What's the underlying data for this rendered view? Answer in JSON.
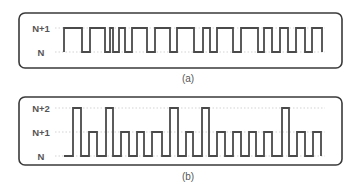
{
  "figure": {
    "panel_a": {
      "caption": "(a)",
      "levels": [
        {
          "label": "N+1",
          "y": 28
        },
        {
          "label": "N",
          "y": 52
        }
      ],
      "box": {
        "x": 19,
        "y": 13,
        "w": 323,
        "h": 55
      },
      "waveform": {
        "description": "Two-level signal alternating between N and N+1",
        "start_x": 64,
        "end_x": 322,
        "segments": [
          [
            64,
            1
          ],
          [
            82,
            0
          ],
          [
            90,
            1
          ],
          [
            105,
            0
          ],
          [
            110,
            1
          ],
          [
            113,
            0
          ],
          [
            119,
            1
          ],
          [
            125,
            0
          ],
          [
            132,
            1
          ],
          [
            147,
            0
          ],
          [
            155,
            1
          ],
          [
            170,
            0
          ],
          [
            177,
            1
          ],
          [
            194,
            0
          ],
          [
            203,
            1
          ],
          [
            210,
            0
          ],
          [
            217,
            1
          ],
          [
            233,
            0
          ],
          [
            241,
            1
          ],
          [
            258,
            0
          ],
          [
            264,
            1
          ],
          [
            272,
            0
          ],
          [
            280,
            1
          ],
          [
            288,
            0
          ],
          [
            296,
            1
          ],
          [
            305,
            0
          ],
          [
            312,
            1
          ],
          [
            322,
            0
          ]
        ]
      }
    },
    "panel_b": {
      "caption": "(b)",
      "levels": [
        {
          "label": "N+2",
          "y": 108
        },
        {
          "label": "N+1",
          "y": 132
        },
        {
          "label": "N",
          "y": 156
        }
      ],
      "box": {
        "x": 19,
        "y": 97,
        "w": 323,
        "h": 68
      },
      "waveform": {
        "description": "Three-level pulse train returning to N between pulses",
        "baseline_start_x": 64,
        "pulses": [
          {
            "x0": 73,
            "x1": 81,
            "level": 2
          },
          {
            "x0": 89,
            "x1": 97,
            "level": 1
          },
          {
            "x0": 106,
            "x1": 113,
            "level": 2
          },
          {
            "x0": 121,
            "x1": 129,
            "level": 1
          },
          {
            "x0": 137,
            "x1": 144,
            "level": 1
          },
          {
            "x0": 152,
            "x1": 162,
            "level": 1
          },
          {
            "x0": 170,
            "x1": 178,
            "level": 2
          },
          {
            "x0": 186,
            "x1": 193,
            "level": 1
          },
          {
            "x0": 202,
            "x1": 209,
            "level": 2
          },
          {
            "x0": 217,
            "x1": 225,
            "level": 1
          },
          {
            "x0": 233,
            "x1": 241,
            "level": 1
          },
          {
            "x0": 249,
            "x1": 256,
            "level": 1
          },
          {
            "x0": 264,
            "x1": 272,
            "level": 1
          },
          {
            "x0": 282,
            "x1": 289,
            "level": 2
          },
          {
            "x0": 297,
            "x1": 305,
            "level": 1
          },
          {
            "x0": 313,
            "x1": 321,
            "level": 1
          }
        ]
      }
    }
  }
}
